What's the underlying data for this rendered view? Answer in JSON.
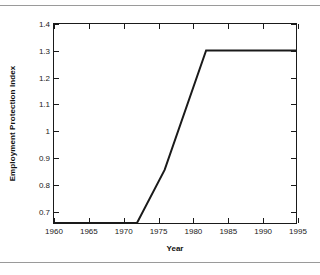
{
  "figure": {
    "background_color": "#ffffff",
    "rule_color": "#9a9a9a",
    "axis_color": "#1a1a1a"
  },
  "chart_data": {
    "type": "line",
    "title": "",
    "xlabel": "Year",
    "ylabel": "Employment Protection Index",
    "xlim": [
      1960,
      1995
    ],
    "ylim": [
      0.65,
      1.4
    ],
    "grid": false,
    "legend": null,
    "xticks": [
      1960,
      1965,
      1970,
      1975,
      1980,
      1985,
      1990,
      1995
    ],
    "xtick_labels": [
      "1960",
      "1965",
      "1970",
      "1975",
      "1980",
      "1985",
      "1990",
      "1995"
    ],
    "yticks": [
      0.7,
      0.8,
      0.9,
      1.0,
      1.1,
      1.2,
      1.3,
      1.4
    ],
    "ytick_labels": [
      "0.7",
      "0.8",
      "0.9",
      "1",
      "1.1",
      "1.2",
      "1.3",
      "1.4"
    ],
    "series": [
      {
        "name": "Employment Protection Index",
        "color": "#1a1a1a",
        "line_width": 2,
        "x": [
          1960,
          1972,
          1976,
          1982,
          1995
        ],
        "y": [
          0.65,
          0.65,
          0.85,
          1.3,
          1.3
        ]
      }
    ]
  }
}
